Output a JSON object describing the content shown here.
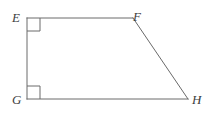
{
  "figure": {
    "kind": "geometry-diagram",
    "shape_name": "right trapezoid",
    "background_color": "#ffffff",
    "stroke_color": "#6a6a6a",
    "label_color": "#3d3d3d",
    "stroke_width": 1,
    "canvas": {
      "width": 211,
      "height": 117
    },
    "vertices": [
      {
        "id": "E",
        "label": "E",
        "x": 27,
        "y": 18
      },
      {
        "id": "F",
        "label": "F",
        "x": 133,
        "y": 18
      },
      {
        "id": "G",
        "label": "G",
        "x": 27,
        "y": 99
      },
      {
        "id": "H",
        "label": "H",
        "x": 188,
        "y": 99
      }
    ],
    "edges": [
      {
        "id": "EF",
        "from": "E",
        "to": "F",
        "x1": 27,
        "y1": 18,
        "x2": 133,
        "y2": 18
      },
      {
        "id": "FH",
        "from": "F",
        "to": "H",
        "x1": 133,
        "y1": 18,
        "x2": 188,
        "y2": 99
      },
      {
        "id": "HG",
        "from": "H",
        "to": "G",
        "x1": 188,
        "y1": 99,
        "x2": 27,
        "y2": 99
      },
      {
        "id": "GE",
        "from": "G",
        "to": "E",
        "x1": 27,
        "y1": 99,
        "x2": 27,
        "y2": 18
      }
    ],
    "right_angle_marks": [
      {
        "id": "angle-E",
        "at": "E",
        "x": 27,
        "y": 18,
        "size": 13,
        "dir_x": 1,
        "dir_y": 1
      },
      {
        "id": "angle-G",
        "at": "G",
        "x": 27,
        "y": 99,
        "size": 13,
        "dir_x": 1,
        "dir_y": -1
      }
    ]
  }
}
